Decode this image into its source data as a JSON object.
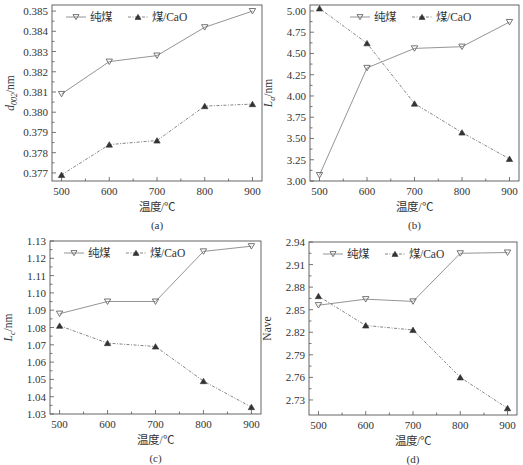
{
  "figure": {
    "legend": {
      "series1": "纯煤",
      "series2": "煤/CaO"
    },
    "xlabel": "温度/℃"
  },
  "chart_data": [
    {
      "id": "a",
      "type": "line",
      "sublabel": "(a)",
      "xlabel": "温度/℃",
      "ylabel": "d002/nm",
      "ylabel_main": "d",
      "ylabel_sub": "002",
      "ylabel_unit": "/nm",
      "x": [
        500,
        600,
        700,
        800,
        900
      ],
      "xlim": [
        480,
        920
      ],
      "ylim": [
        0.3766,
        0.3853
      ],
      "yticks": [
        0.377,
        0.378,
        0.379,
        0.38,
        0.381,
        0.382,
        0.383,
        0.384,
        0.385
      ],
      "ytick_labels": [
        "0.377",
        "0.378",
        "0.379",
        "0.380",
        "0.381",
        "0.382",
        "0.383",
        "0.384",
        "0.385"
      ],
      "xticks": [
        500,
        600,
        700,
        800,
        900
      ],
      "xtick_labels": [
        "500",
        "600",
        "700",
        "800",
        "900"
      ],
      "series": [
        {
          "name": "纯煤",
          "marker": "down-triangle",
          "style": "solid",
          "values": [
            0.3809,
            0.3825,
            0.3828,
            0.3842,
            0.385
          ]
        },
        {
          "name": "煤/CaO",
          "marker": "up-triangle",
          "style": "dash-dot",
          "values": [
            0.3769,
            0.3784,
            0.3786,
            0.3803,
            0.3804
          ]
        }
      ],
      "legend_position": "top-left",
      "grid": false,
      "box": {
        "x0": 52,
        "y0": 5,
        "x1": 262,
        "y1": 181
      }
    },
    {
      "id": "b",
      "type": "line",
      "sublabel": "(b)",
      "xlabel": "温度/℃",
      "ylabel": "La/nm",
      "ylabel_main": "L",
      "ylabel_sub": "a",
      "ylabel_unit": "/nm",
      "x": [
        500,
        600,
        700,
        800,
        900
      ],
      "xlim": [
        480,
        920
      ],
      "ylim": [
        3.0,
        5.07
      ],
      "yticks": [
        3.0,
        3.25,
        3.5,
        3.75,
        4.0,
        4.25,
        4.5,
        4.75,
        5.0
      ],
      "ytick_labels": [
        "3.00",
        "3.25",
        "3.50",
        "3.75",
        "4.00",
        "4.25",
        "4.50",
        "4.75",
        "5.00"
      ],
      "xticks": [
        500,
        600,
        700,
        800,
        900
      ],
      "xtick_labels": [
        "500",
        "600",
        "700",
        "800",
        "900"
      ],
      "series": [
        {
          "name": "纯煤",
          "marker": "down-triangle",
          "style": "solid",
          "values": [
            3.07,
            4.33,
            4.56,
            4.58,
            4.87
          ]
        },
        {
          "name": "煤/CaO",
          "marker": "up-triangle",
          "style": "dash-dot",
          "values": [
            5.03,
            4.62,
            3.91,
            3.57,
            3.26
          ]
        }
      ],
      "legend_position": "top-center",
      "grid": false,
      "box": {
        "x0": 310,
        "y0": 5,
        "x1": 519,
        "y1": 181
      }
    },
    {
      "id": "c",
      "type": "line",
      "sublabel": "(c)",
      "xlabel": "温度/℃",
      "ylabel": "Lc/nm",
      "ylabel_main": "L",
      "ylabel_sub": "c",
      "ylabel_unit": "/nm",
      "x": [
        500,
        600,
        700,
        800,
        900
      ],
      "xlim": [
        480,
        920
      ],
      "ylim": [
        1.03,
        1.13
      ],
      "yticks": [
        1.03,
        1.04,
        1.05,
        1.06,
        1.07,
        1.08,
        1.09,
        1.1,
        1.11,
        1.12,
        1.13
      ],
      "ytick_labels": [
        "1.03",
        "1.04",
        "1.05",
        "1.06",
        "1.07",
        "1.08",
        "1.09",
        "1.10",
        "1.11",
        "1.12",
        "1.13"
      ],
      "xticks": [
        500,
        600,
        700,
        800,
        900
      ],
      "xtick_labels": [
        "500",
        "600",
        "700",
        "800",
        "900"
      ],
      "series": [
        {
          "name": "纯煤",
          "marker": "down-triangle",
          "style": "solid",
          "values": [
            1.088,
            1.095,
            1.095,
            1.124,
            1.127
          ]
        },
        {
          "name": "煤/CaO",
          "marker": "up-triangle",
          "style": "dash-dot",
          "values": [
            1.081,
            1.071,
            1.069,
            1.049,
            1.034
          ]
        }
      ],
      "legend_position": "top-left",
      "grid": false,
      "box": {
        "x0": 50,
        "y0": 241,
        "x1": 261,
        "y1": 414
      }
    },
    {
      "id": "d",
      "type": "line",
      "sublabel": "(d)",
      "xlabel": "温度/℃",
      "ylabel": "Nave",
      "ylabel_main": "Nave",
      "ylabel_sub": "",
      "ylabel_unit": "",
      "x": [
        500,
        600,
        700,
        800,
        900
      ],
      "xlim": [
        480,
        920
      ],
      "ylim": [
        2.71,
        2.94
      ],
      "yticks": [
        2.73,
        2.76,
        2.79,
        2.82,
        2.85,
        2.88,
        2.91,
        2.94
      ],
      "ytick_labels": [
        "2.73",
        "2.76",
        "2.79",
        "2.82",
        "2.85",
        "2.88",
        "2.91",
        "2.94"
      ],
      "xticks": [
        500,
        600,
        700,
        800,
        900
      ],
      "xtick_labels": [
        "500",
        "600",
        "700",
        "800",
        "900"
      ],
      "series": [
        {
          "name": "纯煤",
          "marker": "down-triangle",
          "style": "solid",
          "values": [
            2.856,
            2.864,
            2.861,
            2.925,
            2.926
          ]
        },
        {
          "name": "煤/CaO",
          "marker": "up-triangle",
          "style": "dash-dot",
          "values": [
            2.868,
            2.829,
            2.823,
            2.76,
            2.719
          ]
        }
      ],
      "legend_position": "top-left",
      "grid": false,
      "box": {
        "x0": 309,
        "y0": 242,
        "x1": 517,
        "y1": 415
      }
    }
  ]
}
